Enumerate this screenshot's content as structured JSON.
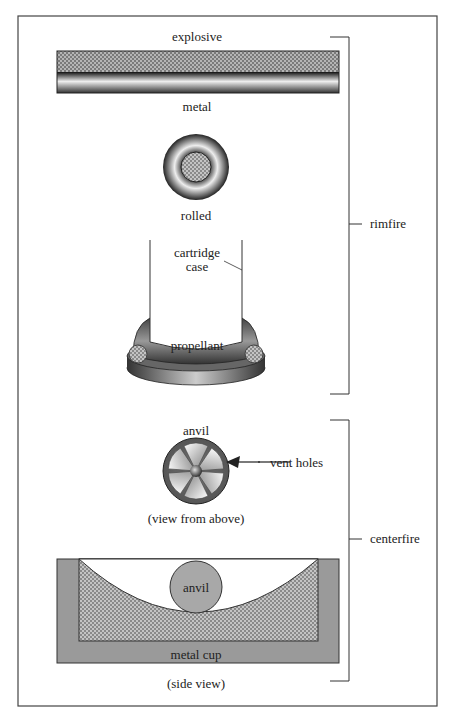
{
  "labels": {
    "explosive": "explosive",
    "metal": "metal",
    "rolled": "rolled",
    "cartridge_case_line1": "cartridge",
    "cartridge_case_line2": "case",
    "propellant": "propellant",
    "rimfire": "rimfire",
    "anvil_top": "anvil",
    "vent_holes": "vent holes",
    "view_from_above": "(view from above)",
    "centerfire": "centerfire",
    "anvil_side": "anvil",
    "metal_cup": "metal cup",
    "side_view": "(side view)"
  },
  "colors": {
    "border": "#444444",
    "cup_gray": "#9a9a9a",
    "anvil_gray": "#a8a8a8",
    "explosive_dark": "#6a6a6a",
    "explosive_light": "#b0b0b0"
  }
}
